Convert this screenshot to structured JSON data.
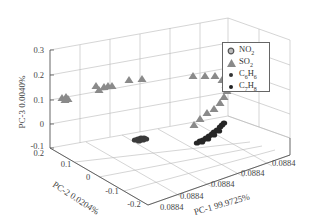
{
  "chart_data": {
    "type": "scatter",
    "dimensions": 3,
    "title": "",
    "axes": {
      "x": {
        "label": "PC-1 99.9725%",
        "ticks": [
          "0.0884",
          "0.0884",
          "0.0884",
          "0.0884",
          "0.0884"
        ]
      },
      "y": {
        "label": "PC-2 0.0204%",
        "ticks": [
          "0.2",
          "0.1",
          "0",
          "-0.1",
          "-0.2"
        ],
        "range": [
          -0.2,
          0.2
        ]
      },
      "z": {
        "label": "PC-3 0.0040%",
        "ticks": [
          "0.3",
          "0.2",
          "0.1",
          "0",
          "-0.1"
        ],
        "range": [
          -0.1,
          0.3
        ]
      }
    },
    "grid": true,
    "legend_position": "upper right",
    "series": [
      {
        "name": "NO2",
        "display_name": "NO₂",
        "marker": "circle-open",
        "color": "#7a7a7a",
        "points_description": "not distinctly visible; overlaps other clusters"
      },
      {
        "name": "SO2",
        "display_name": "SO₂",
        "marker": "triangle",
        "color": "#888888",
        "points_description": "arc of ~20 points rising from PC-3≈0.1 at left, along PC-3≈0.2 plane, curving down toward PC-3≈0 on right",
        "screen_points": [
          [
            62,
            98
          ],
          [
            66,
            97
          ],
          [
            68,
            99
          ],
          [
            65,
            100
          ],
          [
            96,
            86
          ],
          [
            99,
            90
          ],
          [
            104,
            87
          ],
          [
            108,
            86
          ],
          [
            112,
            86
          ],
          [
            129,
            80
          ],
          [
            142,
            79
          ],
          [
            193,
            76
          ],
          [
            205,
            76
          ],
          [
            215,
            76
          ],
          [
            222,
            80
          ],
          [
            226,
            85
          ],
          [
            227,
            91
          ],
          [
            224,
            97
          ],
          [
            220,
            103
          ],
          [
            214,
            109
          ],
          [
            207,
            113
          ],
          [
            200,
            119
          ],
          [
            194,
            125
          ]
        ]
      },
      {
        "name": "C6H6",
        "display_name": "C₆H₆",
        "marker": "dot",
        "color": "#333333",
        "points_description": "tight elongated cluster near floor centre-left",
        "screen_points": [
          [
            135,
            140
          ],
          [
            138,
            139
          ],
          [
            141,
            138
          ],
          [
            144,
            138
          ],
          [
            146,
            139
          ],
          [
            143,
            140
          ],
          [
            139,
            141
          ]
        ]
      },
      {
        "name": "C7H8",
        "display_name": "C₇H₈",
        "marker": "dot",
        "color": "#222222",
        "points_description": "elongated diagonal cluster near floor on right",
        "screen_points": [
          [
            197,
            143
          ],
          [
            200,
            141
          ],
          [
            203,
            140
          ],
          [
            206,
            138
          ],
          [
            209,
            136
          ],
          [
            212,
            134
          ],
          [
            214,
            132
          ],
          [
            217,
            130
          ],
          [
            220,
            127
          ],
          [
            222,
            125
          ],
          [
            224,
            123
          ],
          [
            202,
            142
          ],
          [
            208,
            139
          ],
          [
            214,
            135
          ],
          [
            219,
            131
          ]
        ]
      }
    ]
  },
  "legend": {
    "items": [
      {
        "label": "NO",
        "sub": "2",
        "marker": "circle-open"
      },
      {
        "label": "SO",
        "sub": "2",
        "marker": "triangle"
      },
      {
        "label": "C",
        "sub": "6",
        "label2": "H",
        "sub2": "6",
        "marker": "dot"
      },
      {
        "label": "C",
        "sub": "7",
        "label2": "H",
        "sub2": "8",
        "marker": "dot"
      }
    ]
  },
  "labels": {
    "z_axis": "PC-3 0.0040%",
    "y_axis": "PC-2 0.0204%",
    "x_axis": "PC-1 99.9725%",
    "z_ticks": [
      "0.3",
      "0.2",
      "0.1",
      "0",
      "-0.1"
    ],
    "y_ticks": [
      "0.2",
      "0.1",
      "0",
      "-0.1",
      "-0.2"
    ],
    "x_ticks": [
      "0.0884",
      "0.0884",
      "0.0884",
      "0.0884",
      "0.0884"
    ]
  }
}
